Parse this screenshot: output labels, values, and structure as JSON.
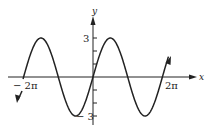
{
  "chart_data": {
    "type": "line",
    "title": "",
    "function": "y = 3 sin(x)",
    "xlabel": "x",
    "ylabel": "y",
    "x_ticks": [
      {
        "value": -6.2832,
        "label": "− 2π"
      },
      {
        "value": 6.2832,
        "label": "2π"
      }
    ],
    "y_ticks": [
      {
        "value": 3,
        "label": "3"
      },
      {
        "value": -3,
        "label": "− 3"
      }
    ],
    "xlim": [
      -6.6,
      7.4
    ],
    "ylim": [
      -3.5,
      4.7
    ],
    "grid": false,
    "series": [
      {
        "name": "3 sin x",
        "x": [
          -6.2832,
          -4.7124,
          -3.1416,
          -1.5708,
          0,
          1.5708,
          3.1416,
          4.7124,
          6.2832
        ],
        "values": [
          0,
          3,
          0,
          -3,
          0,
          3,
          0,
          -3,
          0
        ]
      }
    ]
  },
  "labels": {
    "x_axis": "x",
    "y_axis": "y",
    "y_pos": "3",
    "y_neg": "− 3",
    "x_neg": "− 2π",
    "x_pos": "2π"
  }
}
